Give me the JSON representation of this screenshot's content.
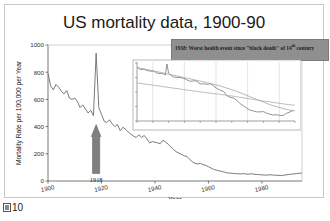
{
  "figure": {
    "caption_number": "10",
    "caption_glyph": "missing-cjk-glyph"
  },
  "chart_data": {
    "type": "line",
    "title": "US mortality data, 1900-90",
    "xlabel": "Year",
    "ylabel": "Mortality Rate per 100,000 per Year",
    "xlim": [
      1900,
      1995
    ],
    "ylim": [
      0,
      1000
    ],
    "xticks": [
      "1900",
      "1920",
      "1940",
      "1960",
      "1980"
    ],
    "xtick_values": [
      1900,
      1920,
      1940,
      1960,
      1980
    ],
    "yticks": [
      "0",
      "200",
      "400",
      "600",
      "800",
      "1000"
    ],
    "ytick_values": [
      0,
      200,
      400,
      600,
      800,
      1000
    ],
    "grid": false,
    "legend": "none",
    "line_color": "#6b6b6b",
    "series": [
      {
        "name": "US mortality rate",
        "x": [
          1900,
          1901,
          1902,
          1903,
          1904,
          1905,
          1906,
          1907,
          1908,
          1909,
          1910,
          1911,
          1912,
          1913,
          1914,
          1915,
          1916,
          1917,
          1918,
          1919,
          1920,
          1921,
          1922,
          1923,
          1924,
          1925,
          1926,
          1927,
          1928,
          1929,
          1930,
          1931,
          1932,
          1933,
          1934,
          1935,
          1936,
          1937,
          1938,
          1939,
          1940,
          1941,
          1942,
          1943,
          1944,
          1945,
          1946,
          1947,
          1948,
          1949,
          1950,
          1951,
          1952,
          1953,
          1954,
          1955,
          1956,
          1957,
          1958,
          1959,
          1960,
          1961,
          1962,
          1963,
          1964,
          1965,
          1966,
          1967,
          1968,
          1969,
          1970,
          1971,
          1972,
          1973,
          1974,
          1975,
          1976,
          1977,
          1978,
          1979,
          1980,
          1981,
          1982,
          1983,
          1984,
          1985,
          1986,
          1987,
          1988,
          1989,
          1990,
          1991,
          1992,
          1993,
          1994,
          1995
        ],
        "y": [
          790,
          700,
          670,
          710,
          690,
          660,
          640,
          665,
          610,
          600,
          610,
          585,
          540,
          560,
          530,
          500,
          520,
          480,
          940,
          540,
          490,
          440,
          430,
          450,
          420,
          400,
          415,
          370,
          395,
          380,
          360,
          345,
          330,
          320,
          340,
          320,
          335,
          310,
          280,
          290,
          285,
          280,
          275,
          300,
          285,
          270,
          250,
          230,
          215,
          205,
          195,
          185,
          180,
          160,
          140,
          130,
          125,
          130,
          120,
          115,
          105,
          95,
          85,
          80,
          75,
          70,
          65,
          60,
          58,
          56,
          55,
          53,
          52,
          54,
          52,
          50,
          53,
          50,
          48,
          47,
          45,
          44,
          43,
          46,
          44,
          43,
          42,
          40,
          42,
          45,
          48,
          50,
          52,
          55,
          57,
          58
        ]
      }
    ],
    "annotations": [
      {
        "name": "peak-arrow",
        "label": "1918",
        "x": 1918,
        "points_to_y": 400,
        "color": "#808080",
        "description": "upward arrow pointing at 1918 influenza mortality spike"
      },
      {
        "name": "callout-box",
        "line1": "1918: Worst health event since \"black death\" of",
        "line2_pre": "14",
        "line2_sup": "th",
        "line2_post": " century",
        "background": "#8f8f8f"
      }
    ],
    "inset": {
      "type": "line",
      "description": "log-scale detail of same mortality series with two fitted trend curves",
      "xlim": [
        1900,
        1995
      ],
      "ylim_log": [
        30,
        1000
      ],
      "grid": true,
      "gridline_color": "#d0d0d0",
      "n_xticks": 11,
      "n_yticks": 5,
      "series": [
        {
          "name": "mortality (log)",
          "x": [
            1900,
            1902,
            1904,
            1906,
            1908,
            1910,
            1912,
            1914,
            1916,
            1917,
            1918,
            1919,
            1920,
            1922,
            1924,
            1926,
            1928,
            1930,
            1932,
            1934,
            1936,
            1938,
            1940,
            1942,
            1944,
            1946,
            1948,
            1950,
            1952,
            1954,
            1956,
            1958,
            1960,
            1962,
            1964,
            1966,
            1968,
            1970,
            1972,
            1974,
            1976,
            1978,
            1980,
            1982,
            1984,
            1986,
            1988,
            1990,
            1992,
            1994
          ],
          "y": [
            790,
            670,
            690,
            640,
            610,
            610,
            540,
            530,
            520,
            480,
            940,
            540,
            490,
            430,
            420,
            415,
            395,
            360,
            330,
            340,
            335,
            280,
            285,
            275,
            285,
            250,
            215,
            195,
            180,
            140,
            125,
            120,
            105,
            85,
            75,
            65,
            58,
            55,
            52,
            52,
            53,
            48,
            45,
            43,
            44,
            42,
            42,
            48,
            52,
            57
          ]
        },
        {
          "name": "trend-upper",
          "x": [
            1900,
            1910,
            1920,
            1930,
            1940,
            1950,
            1960,
            1970,
            1980,
            1990,
            1995
          ],
          "y": [
            760,
            620,
            500,
            400,
            320,
            250,
            180,
            120,
            80,
            60,
            55
          ]
        },
        {
          "name": "trend-lower",
          "x": [
            1900,
            1910,
            1920,
            1930,
            1940,
            1950,
            1960,
            1970,
            1980,
            1990,
            1995
          ],
          "y": [
            300,
            260,
            225,
            195,
            170,
            150,
            130,
            110,
            95,
            82,
            78
          ]
        }
      ]
    }
  }
}
